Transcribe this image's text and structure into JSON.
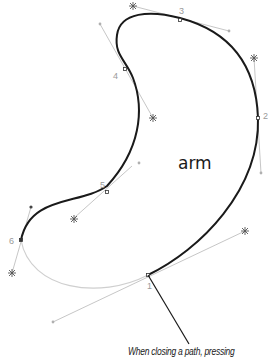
{
  "diagram": {
    "shape_label": "arm",
    "caption": "When closing a path, pressing",
    "anchor_labels": [
      "1",
      "2",
      "3",
      "4",
      "5",
      "6"
    ],
    "colors": {
      "path": "#1a1a1a",
      "closing_segment": "#c8c8c8",
      "handle_line": "#b0b0b0",
      "handle_star": "#555555",
      "label": "#9a9a9a",
      "callout_line": "#1a1a1a"
    }
  }
}
